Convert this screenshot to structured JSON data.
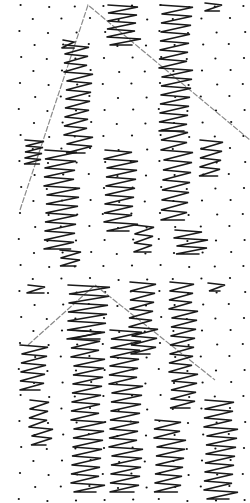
{
  "canvas": {
    "width": 250,
    "height": 503,
    "background": "#ffffff"
  },
  "colors": {
    "ink": "#1a1a1a",
    "dot": "#111111",
    "roof": "#8a8a8a"
  },
  "panels": [
    {
      "name": "top-panel",
      "y_offset": 0,
      "roof": [
        [
          20,
          210
        ],
        [
          88,
          5
        ],
        [
          250,
          140
        ]
      ],
      "zigzags": [
        {
          "x": 63,
          "y": 40,
          "w": 14,
          "rows": 1
        },
        {
          "x": 65,
          "y": 45,
          "w": 25,
          "rows": 12,
          "step": 9
        },
        {
          "x": 108,
          "y": 5,
          "w": 30,
          "rows": 5,
          "step": 8
        },
        {
          "x": 160,
          "y": 5,
          "w": 30,
          "rows": 14,
          "step": 9
        },
        {
          "x": 205,
          "y": 3,
          "w": 18,
          "rows": 1
        },
        {
          "x": 25,
          "y": 140,
          "w": 18,
          "rows": 4,
          "step": 6
        },
        {
          "x": 45,
          "y": 150,
          "w": 32,
          "rows": 11,
          "step": 9
        },
        {
          "x": 105,
          "y": 150,
          "w": 30,
          "rows": 9,
          "step": 9
        },
        {
          "x": 162,
          "y": 130,
          "w": 28,
          "rows": 9,
          "step": 10
        },
        {
          "x": 200,
          "y": 140,
          "w": 22,
          "rows": 4,
          "step": 9
        },
        {
          "x": 60,
          "y": 250,
          "w": 20,
          "rows": 2,
          "step": 8
        },
        {
          "x": 135,
          "y": 225,
          "w": 20,
          "rows": 3,
          "step": 9
        },
        {
          "x": 175,
          "y": 230,
          "w": 30,
          "rows": 3,
          "step": 8
        }
      ]
    },
    {
      "name": "bottom-panel",
      "y_offset": 0,
      "roof": [
        [
          28,
          345
        ],
        [
          95,
          285
        ],
        [
          215,
          380
        ]
      ],
      "zigzags": [
        {
          "x": 28,
          "y": 285,
          "w": 20,
          "rows": 1
        },
        {
          "x": 68,
          "y": 285,
          "w": 40,
          "rows": 6,
          "step": 9
        },
        {
          "x": 130,
          "y": 282,
          "w": 25,
          "rows": 8,
          "step": 9
        },
        {
          "x": 170,
          "y": 282,
          "w": 25,
          "rows": 14,
          "step": 9
        },
        {
          "x": 208,
          "y": 283,
          "w": 15,
          "rows": 1
        },
        {
          "x": 20,
          "y": 345,
          "w": 25,
          "rows": 5,
          "step": 9
        },
        {
          "x": 72,
          "y": 330,
          "w": 30,
          "rows": 18,
          "step": 9
        },
        {
          "x": 110,
          "y": 330,
          "w": 30,
          "rows": 18,
          "step": 9
        },
        {
          "x": 155,
          "y": 420,
          "w": 28,
          "rows": 8,
          "step": 9
        },
        {
          "x": 205,
          "y": 400,
          "w": 30,
          "rows": 11,
          "step": 9
        },
        {
          "x": 30,
          "y": 400,
          "w": 20,
          "rows": 5,
          "step": 9
        }
      ]
    }
  ]
}
